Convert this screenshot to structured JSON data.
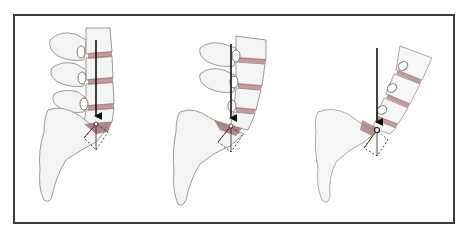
{
  "figure": {
    "type": "anatomical-diagram",
    "panel_count": 3,
    "text_labels": [],
    "colors": {
      "frame": "#3a3a3a",
      "bone_fill": "#f4f4f4",
      "bone_outline": "#9a9a9a",
      "disc": "#b07a7a",
      "l5s1_wedge": "#9c6b6b",
      "force_arrow": "#111111",
      "vector_box": "#222222"
    },
    "panels": [
      {
        "name": "panel-1",
        "description": "upright lumbar spine, vertical load vector at L5-S1 with dotted force-resolution box"
      },
      {
        "name": "panel-2",
        "description": "increased lordosis, vertical load vector at L5-S1 with dotted force-resolution box"
      },
      {
        "name": "panel-3",
        "description": "steep sacral inclination, vertical load vector at L5-S1 with dotted force-resolution box"
      }
    ]
  }
}
